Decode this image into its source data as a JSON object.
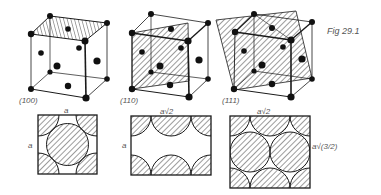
{
  "figure": {
    "caption": "Fig 29.1",
    "panels": [
      {
        "id": "100",
        "plane_label": "(100)",
        "top_dim": "a",
        "side_dim": "a"
      },
      {
        "id": "110",
        "plane_label": "(110)",
        "top_dim": "a√2",
        "side_dim": "a"
      },
      {
        "id": "111",
        "plane_label": "(111)",
        "top_dim": "a√2",
        "side_dim": "a√(3/2)"
      }
    ]
  },
  "colors": {
    "ink": "#1a1a1a",
    "label": "#555555",
    "background": "#ffffff"
  }
}
